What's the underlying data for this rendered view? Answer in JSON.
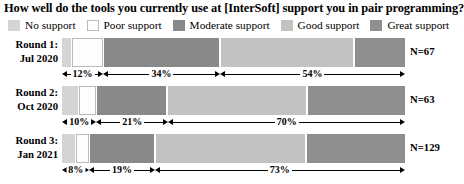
{
  "title": "How well do the tools you currently use at [InterSoft] support you in pair programming?",
  "colors": {
    "no_support": "#d4d4d4",
    "poor_support": "#fdfdfd",
    "moderate_support": "#898989",
    "good_support": "#c2c2c2",
    "great_support": "#8f8f8f",
    "outline": "#bbbbbb",
    "text": "#000000",
    "background": "#ffffff"
  },
  "legend": {
    "items": [
      {
        "label": "No support",
        "swatch": "no_support"
      },
      {
        "label": "Poor support",
        "swatch": "poor_support"
      },
      {
        "label": "Moderate support",
        "swatch": "moderate_support"
      },
      {
        "label": "Good support",
        "swatch": "good_support"
      },
      {
        "label": "Great support",
        "swatch": "great_support"
      }
    ]
  },
  "chart_data": {
    "type": "bar",
    "subtype": "100% stacked horizontal bar (diverging likert)",
    "title": "How well do the tools you currently use at [InterSoft] support you in pair programming?",
    "xlabel": "",
    "ylabel": "",
    "xlim": [
      0,
      100
    ],
    "grid": false,
    "legend_position": "top",
    "categories": [
      "Round 1: Jul 2020",
      "Round 2: Oct 2020",
      "Round 3: Jan 2021"
    ],
    "series": [
      {
        "name": "No support",
        "values": [
          3,
          5,
          4
        ]
      },
      {
        "name": "Poor support",
        "values": [
          9,
          5,
          4
        ]
      },
      {
        "name": "Moderate support",
        "values": [
          34,
          21,
          19
        ]
      },
      {
        "name": "Good support",
        "values": [
          39,
          41,
          44
        ]
      },
      {
        "name": "Great support",
        "values": [
          15,
          29,
          29
        ]
      }
    ],
    "annotations": [
      {
        "row": 0,
        "label": "12%",
        "from": 0,
        "to": 12,
        "meaning": "No support + Poor support"
      },
      {
        "row": 0,
        "label": "34%",
        "from": 12,
        "to": 46,
        "meaning": "Moderate support"
      },
      {
        "row": 0,
        "label": "54%",
        "from": 46,
        "to": 100,
        "meaning": "Good support + Great support"
      },
      {
        "row": 1,
        "label": "10%",
        "from": 0,
        "to": 10,
        "meaning": "No support + Poor support"
      },
      {
        "row": 1,
        "label": "21%",
        "from": 10,
        "to": 31,
        "meaning": "Moderate support"
      },
      {
        "row": 1,
        "label": "70%",
        "from": 31,
        "to": 100,
        "meaning": "Good support + Great support"
      },
      {
        "row": 2,
        "label": "8%",
        "from": 0,
        "to": 8,
        "meaning": "No support + Poor support"
      },
      {
        "row": 2,
        "label": "19%",
        "from": 8,
        "to": 27,
        "meaning": "Moderate support"
      },
      {
        "row": 2,
        "label": "73%",
        "from": 27,
        "to": 100,
        "meaning": "Good support + Great support"
      }
    ]
  },
  "rows": [
    {
      "label_line1": "Round 1:",
      "label_line2": "Jul 2020",
      "n_label": "N=67",
      "segments": [
        {
          "name": "No support",
          "pct": 3,
          "swatch": "no_support"
        },
        {
          "name": "Poor support",
          "pct": 9,
          "swatch": "poor_support"
        },
        {
          "name": "Moderate support",
          "pct": 34,
          "swatch": "moderate_support"
        },
        {
          "name": "Good support",
          "pct": 39,
          "swatch": "good_support"
        },
        {
          "name": "Great support",
          "pct": 15,
          "swatch": "great_support"
        }
      ],
      "annotations": [
        {
          "label": "12%",
          "from": 0,
          "to": 12
        },
        {
          "label": "34%",
          "from": 12,
          "to": 46
        },
        {
          "label": "54%",
          "from": 46,
          "to": 100
        }
      ]
    },
    {
      "label_line1": "Round 2:",
      "label_line2": "Oct 2020",
      "n_label": "N=63",
      "segments": [
        {
          "name": "No support",
          "pct": 5,
          "swatch": "no_support"
        },
        {
          "name": "Poor support",
          "pct": 5,
          "swatch": "poor_support"
        },
        {
          "name": "Moderate support",
          "pct": 21,
          "swatch": "moderate_support"
        },
        {
          "name": "Good support",
          "pct": 41,
          "swatch": "good_support"
        },
        {
          "name": "Great support",
          "pct": 29,
          "swatch": "great_support"
        }
      ],
      "annotations": [
        {
          "label": "10%",
          "from": 0,
          "to": 10
        },
        {
          "label": "21%",
          "from": 10,
          "to": 31
        },
        {
          "label": "70%",
          "from": 31,
          "to": 100
        }
      ]
    },
    {
      "label_line1": "Round 3:",
      "label_line2": "Jan 2021",
      "n_label": "N=129",
      "segments": [
        {
          "name": "No support",
          "pct": 4,
          "swatch": "no_support"
        },
        {
          "name": "Poor support",
          "pct": 4,
          "swatch": "poor_support"
        },
        {
          "name": "Moderate support",
          "pct": 19,
          "swatch": "moderate_support"
        },
        {
          "name": "Good support",
          "pct": 44,
          "swatch": "good_support"
        },
        {
          "name": "Great support",
          "pct": 29,
          "swatch": "great_support"
        }
      ],
      "annotations": [
        {
          "label": "8%",
          "from": 0,
          "to": 8
        },
        {
          "label": "19%",
          "from": 8,
          "to": 27
        },
        {
          "label": "73%",
          "from": 27,
          "to": 100
        }
      ]
    }
  ]
}
